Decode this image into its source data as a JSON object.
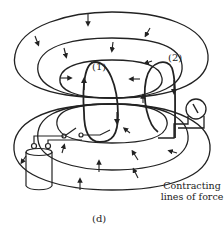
{
  "diagram": {
    "labels": {
      "circuit_1": "(1)",
      "circuit_2": "(2)",
      "caption_line1": "Contracting",
      "caption_line2": "lines of force",
      "subfigure": "(d)"
    },
    "components": [
      "magnetic-field-loops",
      "loop-1",
      "loop-2",
      "galvanometer",
      "battery-cell",
      "switch"
    ],
    "colors": {
      "ink": "#222222",
      "background": "#ffffff"
    }
  }
}
